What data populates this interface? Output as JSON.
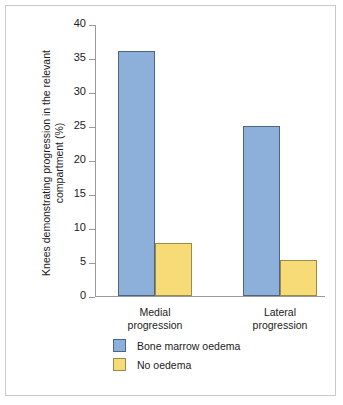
{
  "chart_data": {
    "type": "bar",
    "title": "",
    "xlabel": "",
    "ylabel": "Knees demonstrating progression in the relevant compartment (%)",
    "ylabel_lines": [
      "Knees demonstrating progression in the relevant",
      "compartment (%)"
    ],
    "categories": [
      "Medial progression",
      "Lateral progression"
    ],
    "category_lines": [
      [
        "Medial",
        "progression"
      ],
      [
        "Lateral",
        "progression"
      ]
    ],
    "series": [
      {
        "name": "Bone marrow oedema",
        "values": [
          36,
          25
        ],
        "color": "#8cb0d9"
      },
      {
        "name": "No oedema",
        "values": [
          7.8,
          5.3
        ],
        "color": "#f6db76"
      }
    ],
    "ylim": [
      0,
      40
    ],
    "ytick_step": 5,
    "yticks": [
      0,
      5,
      10,
      15,
      20,
      25,
      30,
      35,
      40
    ],
    "ytick_labels": [
      "0",
      "5",
      "10",
      "15",
      "20",
      "25",
      "30",
      "35",
      "40"
    ],
    "grid": false,
    "legend_position": "bottom-left",
    "legend": [
      {
        "label": "Bone marrow oedema",
        "color": "#8cb0d9"
      },
      {
        "label": "No oedema",
        "color": "#f6db76"
      }
    ],
    "axis_color": "#9a9a9a",
    "frame_color": "#c9c9c9",
    "text_color": "#1b1b1b"
  }
}
